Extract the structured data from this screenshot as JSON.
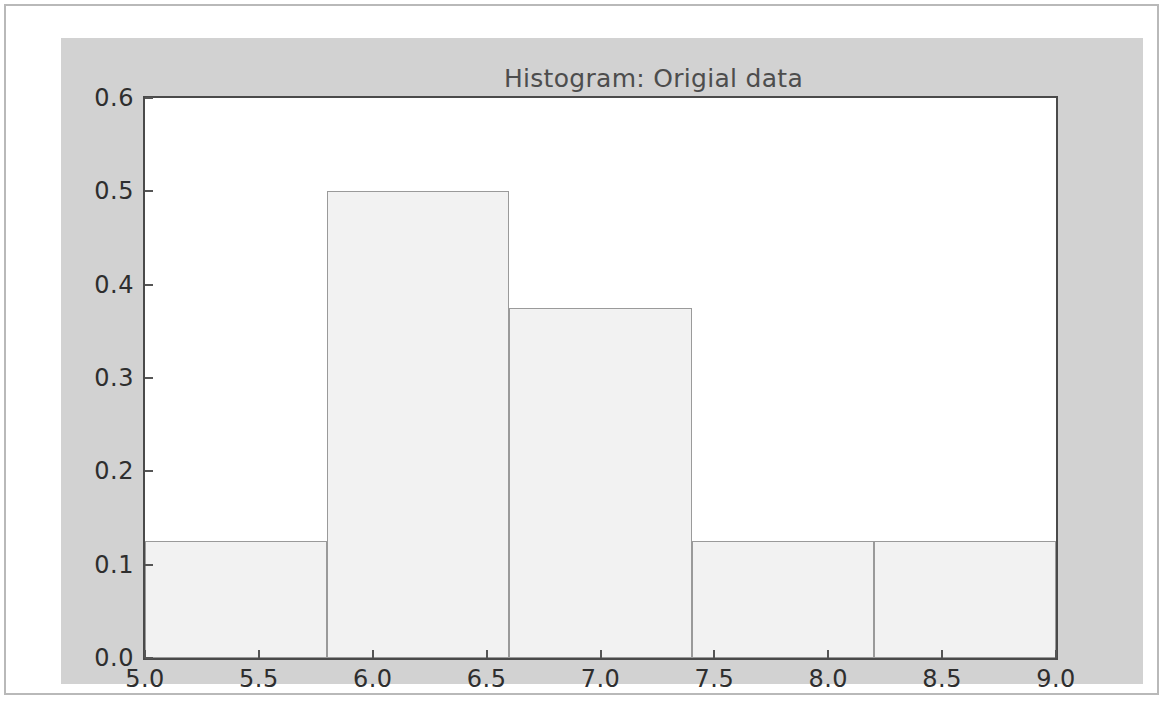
{
  "figure": {
    "background_color": "#d2d2d2",
    "plot_background_color": "#ffffff",
    "frame_color": "#4a4a4a"
  },
  "chart_data": {
    "type": "bar",
    "title": "Histogram: Origial data",
    "xlabel": "",
    "ylabel": "",
    "xlim": [
      5.0,
      9.0
    ],
    "ylim": [
      0.0,
      0.6
    ],
    "grid": false,
    "legend": null,
    "bar_fill_color": "#f2f2f2",
    "bar_edge_color": "#9a9a9a",
    "bin_edges": [
      5.0,
      5.8,
      6.6,
      7.4,
      8.2,
      9.0
    ],
    "bin_width": 0.8,
    "categories": [
      "5.0-5.8",
      "5.8-6.6",
      "6.6-7.4",
      "7.4-8.2",
      "8.2-9.0"
    ],
    "values": [
      0.125,
      0.5,
      0.375,
      0.125,
      0.125
    ],
    "xticks": [
      5.0,
      5.5,
      6.0,
      6.5,
      7.0,
      7.5,
      8.0,
      8.5,
      9.0
    ],
    "xtick_labels": [
      "5.0",
      "5.5",
      "6.0",
      "6.5",
      "7.0",
      "7.5",
      "8.0",
      "8.5",
      "9.0"
    ],
    "yticks": [
      0.0,
      0.1,
      0.2,
      0.3,
      0.4,
      0.5,
      0.6
    ],
    "ytick_labels": [
      "0.0",
      "0.1",
      "0.2",
      "0.3",
      "0.4",
      "0.5",
      "0.6"
    ]
  }
}
